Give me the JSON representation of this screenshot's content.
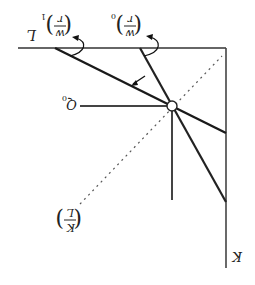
{
  "diagram": {
    "orientation": "rotated-180",
    "axes": {
      "horizontal_label": "L",
      "vertical_label": "K"
    },
    "labels": {
      "wage_rental_0": {
        "num": "w",
        "den": "r",
        "sub": "0"
      },
      "wage_rental_1": {
        "num": "w",
        "den": "r",
        "sub": "1"
      },
      "isoquant": {
        "base": "Q",
        "sub": "0"
      },
      "capital_labor_ratio": {
        "num": "K",
        "den": "L"
      }
    },
    "colors": {
      "line": "#1a1a1a",
      "axis": "#333333",
      "dotted": "#555555",
      "background": "#ffffff"
    }
  }
}
